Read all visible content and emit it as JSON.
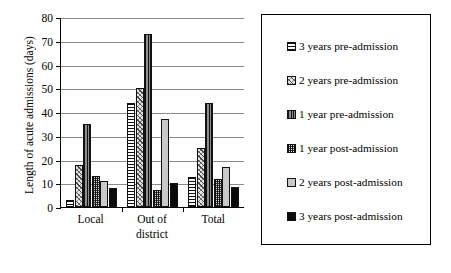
{
  "chart_data": {
    "type": "bar",
    "title": "",
    "xlabel": "",
    "ylabel": "Length of acute admissions (days)",
    "ylim": [
      0,
      80
    ],
    "ytick_labels": [
      "0",
      "10",
      "20",
      "30",
      "40",
      "50",
      "60",
      "70",
      "80"
    ],
    "ytick_values": [
      0,
      10,
      20,
      30,
      40,
      50,
      60,
      70,
      80
    ],
    "grid": true,
    "legend_position": "right",
    "categories": [
      "Local",
      "Out of district",
      "Total"
    ],
    "category_lines": [
      [
        "Local"
      ],
      [
        "Out of",
        "district"
      ],
      [
        "Total"
      ]
    ],
    "series": [
      {
        "name": "3 years pre-admission",
        "swatch": "horizontal-lines-pattern",
        "values": [
          3,
          44,
          12.5
        ]
      },
      {
        "name": "2 years pre-admission",
        "swatch": "diagonal-hatch-pattern",
        "values": [
          17.5,
          50,
          25
        ]
      },
      {
        "name": "1 year pre-admission",
        "swatch": "vertical-lines-pattern",
        "values": [
          35,
          73,
          44
        ]
      },
      {
        "name": "1 year post-admission",
        "swatch": "checkered-pattern",
        "values": [
          13,
          7,
          12
        ]
      },
      {
        "name": "2 years post-admission",
        "swatch": "light-grey-solid",
        "values": [
          11,
          37,
          17
        ]
      },
      {
        "name": "3 years post-admission",
        "swatch": "black-solid",
        "values": [
          8,
          10,
          8.5
        ]
      }
    ]
  },
  "legend": {
    "items": [
      {
        "label": "3 years pre-admission"
      },
      {
        "label": "2 years pre-admission"
      },
      {
        "label": "1 year pre-admission"
      },
      {
        "label": "1 year post-admission"
      },
      {
        "label": "2 years post-admission"
      },
      {
        "label": "3 years post-admission"
      }
    ]
  },
  "colors": {
    "axis": "#000000",
    "gridline": "#8a8a8a",
    "background": "#ffffff",
    "series_black": "#0a0a0a",
    "series_light_grey": "#c9c9c9",
    "series_dark_grey": "#4c4c4c"
  }
}
